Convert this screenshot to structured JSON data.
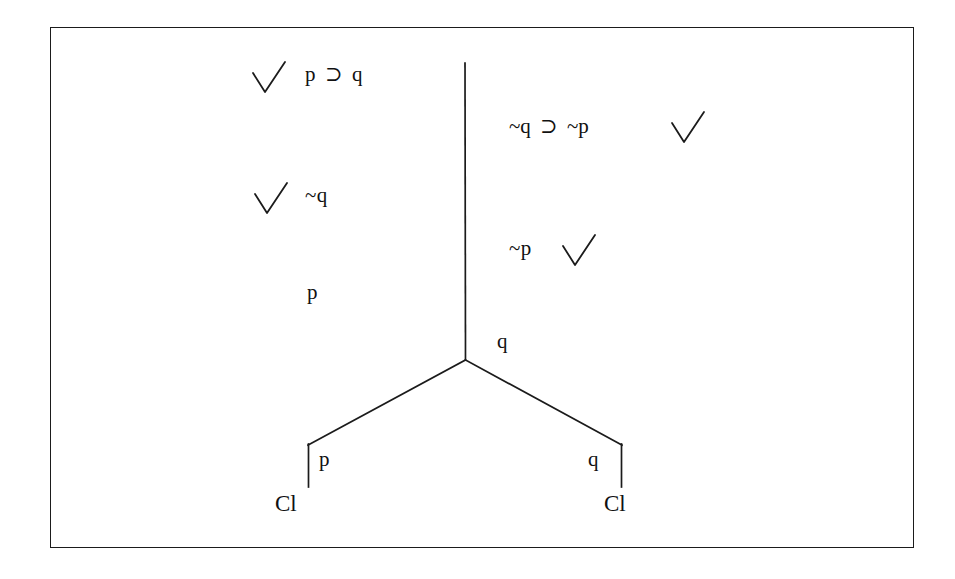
{
  "diagram": {
    "type": "semantic-tableau",
    "symbols": {
      "horseshoe": "⊃",
      "negation": "~",
      "check": "check-mark"
    },
    "nodes": [
      {
        "id": "premise-1",
        "name": "premise-p-horseshoe-q",
        "text": "p ⊃ q",
        "antecedent": "p",
        "operator": "⊃",
        "consequent": "q",
        "checked": true,
        "check_side": "left",
        "branch": "left",
        "x": 305,
        "y": 64
      },
      {
        "id": "premise-2",
        "name": "premise-notq-horseshoe-notp",
        "text": "~q ⊃ ~p",
        "antecedent": "~q",
        "operator": "⊃",
        "consequent": "~p",
        "checked": true,
        "check_side": "right",
        "branch": "right",
        "x": 509,
        "y": 116
      },
      {
        "id": "premise-3",
        "name": "premise-not-q",
        "text": "~q",
        "checked": true,
        "check_side": "left",
        "branch": "left",
        "x": 305,
        "y": 185
      },
      {
        "id": "derived-1",
        "name": "derived-not-p",
        "text": "~p",
        "checked": true,
        "check_side": "right",
        "branch": "right",
        "x": 509,
        "y": 238
      },
      {
        "id": "derived-2",
        "name": "derived-p",
        "text": "p",
        "checked": false,
        "branch": "left",
        "x": 307,
        "y": 282
      },
      {
        "id": "derived-3",
        "name": "derived-q",
        "text": "q",
        "checked": false,
        "branch": "right",
        "x": 497,
        "y": 331
      },
      {
        "id": "leaf-left",
        "name": "branch-left-p",
        "text": "p",
        "checked": false,
        "branch": "left-leaf",
        "x": 319,
        "y": 449
      },
      {
        "id": "leaf-right",
        "name": "branch-right-q",
        "text": "q",
        "checked": false,
        "branch": "right-leaf",
        "x": 588,
        "y": 449
      }
    ],
    "closures": [
      {
        "id": "closure-left",
        "name": "closure-marker-left",
        "text": "Cl",
        "x": 275,
        "y": 492
      },
      {
        "id": "closure-right",
        "name": "closure-marker-right",
        "text": "Cl",
        "x": 604,
        "y": 492
      }
    ],
    "geometry": {
      "trunk": {
        "x": 465,
        "y_top": 63,
        "y_fork": 360
      },
      "fork": {
        "x": 465,
        "y": 360
      },
      "left_branch": {
        "x_end": 308,
        "y_end": 445,
        "stub_y_end": 487
      },
      "right_branch": {
        "x_end": 622,
        "y_end": 445,
        "stub_y_end": 487
      },
      "border": {
        "x": 50,
        "y": 27,
        "width": 864,
        "height": 521
      }
    },
    "colors": {
      "ink": "#111111",
      "border": "#1b1b1b",
      "background": "#ffffff"
    }
  }
}
